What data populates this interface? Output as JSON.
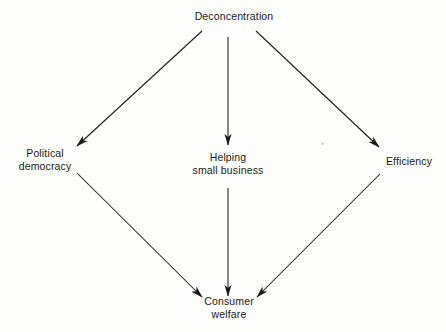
{
  "diagram": {
    "type": "flow-diagram",
    "title_text_present": false,
    "background_color": "#fdfdfc",
    "line_color": "#1a1a1a",
    "text_color": "#1a1a1a",
    "nodes": [
      {
        "id": "deconcentration",
        "lines": [
          "Deconcentration"
        ],
        "x": 234,
        "y": 16
      },
      {
        "id": "political_democracy",
        "lines": [
          "Political",
          "democracy"
        ],
        "x": 45,
        "y": 160
      },
      {
        "id": "helping_small_business",
        "lines": [
          "Helping",
          "small business"
        ],
        "x": 228,
        "y": 164
      },
      {
        "id": "efficiency",
        "lines": [
          "Efficiency"
        ],
        "x": 409,
        "y": 161
      },
      {
        "id": "consumer_welfare",
        "lines": [
          "Consumer",
          "welfare"
        ],
        "x": 229,
        "y": 308
      }
    ],
    "edges": [
      {
        "id": "deconcentration-to-political-democracy",
        "from": "deconcentration",
        "to": "political_democracy",
        "x1": 202,
        "y1": 31,
        "x2": 77,
        "y2": 146,
        "arrowhead": "end"
      },
      {
        "id": "deconcentration-to-helping-small-business",
        "from": "deconcentration",
        "to": "helping_small_business",
        "x1": 228,
        "y1": 37,
        "x2": 228,
        "y2": 145,
        "arrowhead": "end"
      },
      {
        "id": "deconcentration-to-efficiency",
        "from": "deconcentration",
        "to": "efficiency",
        "x1": 256,
        "y1": 31,
        "x2": 379,
        "y2": 147,
        "arrowhead": "end"
      },
      {
        "id": "political-democracy-to-consumer-welfare",
        "from": "political_democracy",
        "to": "consumer_welfare",
        "x1": 77,
        "y1": 173,
        "x2": 202,
        "y2": 297,
        "arrowhead": "end"
      },
      {
        "id": "helping-small-business-to-consumer-welfare",
        "from": "helping_small_business",
        "to": "consumer_welfare",
        "x1": 228,
        "y1": 188,
        "x2": 228,
        "y2": 296,
        "arrowhead": "end"
      },
      {
        "id": "efficiency-to-consumer-welfare",
        "from": "efficiency",
        "to": "consumer_welfare",
        "x1": 380,
        "y1": 174,
        "x2": 257,
        "y2": 297,
        "arrowhead": "end"
      }
    ],
    "artifacts": [
      {
        "id": "scan-speck",
        "x": 321,
        "y": 142
      }
    ]
  }
}
